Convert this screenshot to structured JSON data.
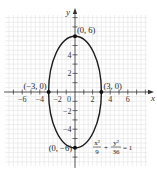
{
  "chart_data": {
    "type": "line",
    "title": "",
    "xlabel": "x",
    "ylabel": "y",
    "xlim": [
      -8,
      8
    ],
    "ylim": [
      -8,
      8
    ],
    "grid": true,
    "x_ticks": [
      -6,
      -4,
      -2,
      2,
      4,
      6
    ],
    "y_ticks": [
      -4,
      -2,
      2,
      4
    ],
    "x_tick_labels": [
      "−6",
      "−4",
      "−2",
      "2",
      "4",
      "6"
    ],
    "y_tick_labels": [
      "−4",
      "−2",
      "2",
      "4"
    ],
    "origin_label": "0",
    "series": [
      {
        "name": "ellipse",
        "equation": "x²/9 + y²/36 = 1",
        "a": 3,
        "b": 6
      }
    ],
    "points": [
      {
        "x": 0,
        "y": 6,
        "label": "(0, 6)",
        "anchor": "right-above"
      },
      {
        "x": 3,
        "y": 0,
        "label": "(3, 0)",
        "anchor": "right-above"
      },
      {
        "x": -3,
        "y": 0,
        "label": "(−3, 0)",
        "anchor": "left-above"
      },
      {
        "x": 0,
        "y": -6,
        "label": "(0, −6)",
        "anchor": "left"
      }
    ],
    "equation_label": {
      "num1": "x²",
      "den1": "9",
      "plus": "+",
      "num2": "y²",
      "den2": "36",
      "rhs": "= 1"
    }
  }
}
